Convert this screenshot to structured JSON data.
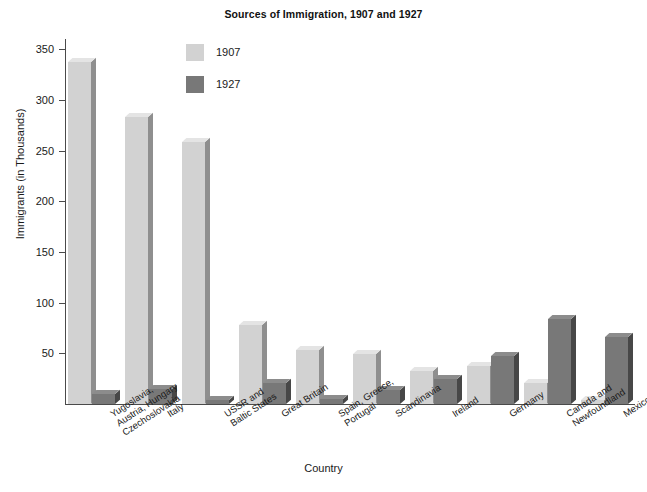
{
  "chart_data": {
    "type": "bar",
    "title": "Sources of Immigration, 1907 and 1927",
    "xlabel": "Country",
    "ylabel": "Immigrants (in Thousands)",
    "ylim": [
      0,
      360
    ],
    "yticks": [
      50,
      100,
      150,
      200,
      250,
      300,
      350
    ],
    "grid": false,
    "legend_position": "upper-center-left",
    "categories": [
      "Yugoslavia,\nAustria, Hungary\nCzechoslovakia",
      "Italy",
      "USSR and\nBaltic States",
      "Great Britain",
      "Spain, Greece,\nPortugal",
      "Scandinavia",
      "Ireland",
      "Germany",
      "Canada and\nNewfoundland",
      "Mexico"
    ],
    "series": [
      {
        "name": "1907",
        "color": "#d2d2d2",
        "values": [
          337,
          283,
          258,
          78,
          53,
          49,
          33,
          37,
          21,
          4
        ]
      },
      {
        "name": "1927",
        "color": "#787878",
        "values": [
          10,
          15,
          4,
          21,
          5,
          14,
          25,
          47,
          84,
          66
        ]
      }
    ]
  },
  "legend": {
    "entries": [
      {
        "label": "1907"
      },
      {
        "label": "1927"
      }
    ]
  },
  "colors": {
    "series_1907_face": "#d2d2d2",
    "series_1907_top": "#e4e4e4",
    "series_1907_side": "#8f8f8f",
    "series_1927_face": "#787878",
    "series_1927_top": "#8c8c8c",
    "series_1927_side": "#474747",
    "axis": "#4a4a4a",
    "text": "#1a1a1a",
    "background": "#ffffff"
  }
}
